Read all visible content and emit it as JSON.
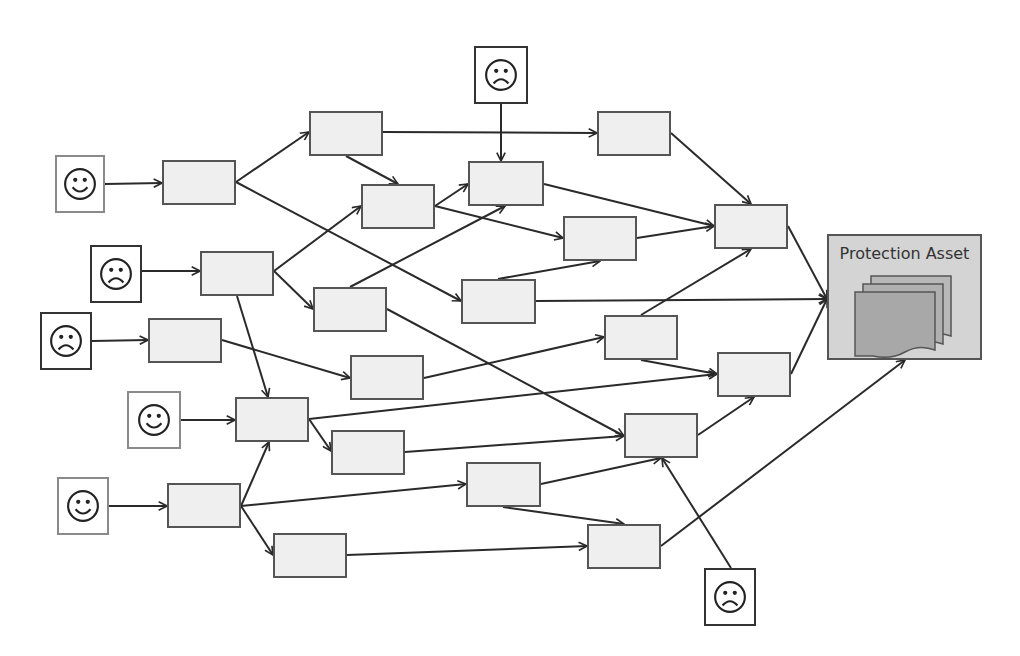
{
  "diagram": {
    "type": "attack-graph",
    "colors": {
      "background": "#ffffff",
      "node_fill": "#efefef",
      "node_border": "#555555",
      "asset_fill": "#d4d4d4",
      "edge": "#2a2a2a",
      "doc_fill": "#a8a8a8"
    },
    "asset": {
      "id": "asset",
      "label": "Protection Asset",
      "icon": "stacked-documents-icon",
      "x": 827,
      "y": 234,
      "w": 155,
      "h": 126
    },
    "actors": [
      {
        "id": "A1",
        "kind": "happy",
        "icon": "smiley-face-icon",
        "x": 55,
        "y": 155,
        "w": 50,
        "h": 58
      },
      {
        "id": "A2",
        "kind": "sad",
        "icon": "frowning-face-icon",
        "x": 90,
        "y": 245,
        "w": 52,
        "h": 58
      },
      {
        "id": "A3",
        "kind": "sad",
        "icon": "frowning-face-icon",
        "x": 40,
        "y": 312,
        "w": 52,
        "h": 58
      },
      {
        "id": "A4",
        "kind": "happy",
        "icon": "smiley-face-icon",
        "x": 127,
        "y": 391,
        "w": 54,
        "h": 58
      },
      {
        "id": "A5",
        "kind": "happy",
        "icon": "smiley-face-icon",
        "x": 57,
        "y": 477,
        "w": 52,
        "h": 58
      },
      {
        "id": "A6",
        "kind": "sad",
        "icon": "frowning-face-icon",
        "x": 474,
        "y": 46,
        "w": 54,
        "h": 58
      },
      {
        "id": "A7",
        "kind": "sad",
        "icon": "frowning-face-icon",
        "x": 704,
        "y": 568,
        "w": 52,
        "h": 58
      }
    ],
    "nodes": [
      {
        "id": "N1",
        "x": 162,
        "y": 160,
        "w": 74,
        "h": 45
      },
      {
        "id": "N2",
        "x": 200,
        "y": 251,
        "w": 74,
        "h": 45
      },
      {
        "id": "N3",
        "x": 148,
        "y": 318,
        "w": 74,
        "h": 45
      },
      {
        "id": "N4",
        "x": 235,
        "y": 397,
        "w": 74,
        "h": 45
      },
      {
        "id": "N5",
        "x": 167,
        "y": 483,
        "w": 74,
        "h": 45
      },
      {
        "id": "N6",
        "x": 309,
        "y": 111,
        "w": 74,
        "h": 45
      },
      {
        "id": "N7",
        "x": 361,
        "y": 184,
        "w": 74,
        "h": 45
      },
      {
        "id": "N8",
        "x": 313,
        "y": 287,
        "w": 74,
        "h": 45
      },
      {
        "id": "N9",
        "x": 350,
        "y": 355,
        "w": 74,
        "h": 45
      },
      {
        "id": "N10",
        "x": 331,
        "y": 430,
        "w": 74,
        "h": 45
      },
      {
        "id": "N11",
        "x": 273,
        "y": 533,
        "w": 74,
        "h": 45
      },
      {
        "id": "N12",
        "x": 468,
        "y": 161,
        "w": 76,
        "h": 45
      },
      {
        "id": "N13",
        "x": 461,
        "y": 279,
        "w": 75,
        "h": 45
      },
      {
        "id": "N14",
        "x": 466,
        "y": 462,
        "w": 75,
        "h": 45
      },
      {
        "id": "N15",
        "x": 597,
        "y": 111,
        "w": 74,
        "h": 45
      },
      {
        "id": "N16",
        "x": 563,
        "y": 216,
        "w": 74,
        "h": 45
      },
      {
        "id": "N17",
        "x": 604,
        "y": 315,
        "w": 74,
        "h": 45
      },
      {
        "id": "N18",
        "x": 624,
        "y": 413,
        "w": 74,
        "h": 45
      },
      {
        "id": "N19",
        "x": 587,
        "y": 524,
        "w": 74,
        "h": 45
      },
      {
        "id": "N20",
        "x": 714,
        "y": 204,
        "w": 74,
        "h": 45
      },
      {
        "id": "N21",
        "x": 717,
        "y": 352,
        "w": 74,
        "h": 45
      }
    ],
    "edges": [
      {
        "from": [
          105,
          184
        ],
        "to": [
          162,
          183
        ]
      },
      {
        "from": [
          142,
          271
        ],
        "to": [
          200,
          271
        ]
      },
      {
        "from": [
          92,
          341
        ],
        "to": [
          148,
          340
        ]
      },
      {
        "from": [
          181,
          420
        ],
        "to": [
          235,
          420
        ]
      },
      {
        "from": [
          109,
          506
        ],
        "to": [
          167,
          506
        ]
      },
      {
        "from": [
          501,
          104
        ],
        "to": [
          501,
          161
        ]
      },
      {
        "from": [
          731,
          568
        ],
        "to": [
          662,
          458
        ]
      },
      {
        "from": [
          236,
          182
        ],
        "to": [
          309,
          132
        ]
      },
      {
        "from": [
          236,
          182
        ],
        "to": [
          461,
          301
        ]
      },
      {
        "from": [
          383,
          132
        ],
        "to": [
          597,
          133
        ]
      },
      {
        "from": [
          346,
          156
        ],
        "to": [
          398,
          184
        ]
      },
      {
        "from": [
          274,
          271
        ],
        "to": [
          361,
          206
        ]
      },
      {
        "from": [
          274,
          271
        ],
        "to": [
          313,
          309
        ]
      },
      {
        "from": [
          237,
          296
        ],
        "to": [
          268,
          397
        ]
      },
      {
        "from": [
          222,
          340
        ],
        "to": [
          350,
          378
        ]
      },
      {
        "from": [
          309,
          419
        ],
        "to": [
          331,
          451
        ]
      },
      {
        "from": [
          241,
          506
        ],
        "to": [
          269,
          442
        ]
      },
      {
        "from": [
          241,
          506
        ],
        "to": [
          466,
          484
        ]
      },
      {
        "from": [
          241,
          506
        ],
        "to": [
          273,
          555
        ]
      },
      {
        "from": [
          435,
          206
        ],
        "to": [
          468,
          184
        ]
      },
      {
        "from": [
          435,
          206
        ],
        "to": [
          563,
          238
        ]
      },
      {
        "from": [
          350,
          287
        ],
        "to": [
          505,
          206
        ]
      },
      {
        "from": [
          387,
          309
        ],
        "to": [
          624,
          436
        ]
      },
      {
        "from": [
          424,
          378
        ],
        "to": [
          604,
          337
        ]
      },
      {
        "from": [
          309,
          419
        ],
        "to": [
          717,
          374
        ]
      },
      {
        "from": [
          405,
          452
        ],
        "to": [
          624,
          436
        ]
      },
      {
        "from": [
          347,
          555
        ],
        "to": [
          587,
          546
        ]
      },
      {
        "from": [
          544,
          184
        ],
        "to": [
          714,
          226
        ]
      },
      {
        "from": [
          498,
          279
        ],
        "to": [
          600,
          261
        ]
      },
      {
        "from": [
          536,
          301
        ],
        "to": [
          827,
          299
        ]
      },
      {
        "from": [
          541,
          484
        ],
        "to": [
          661,
          458
        ]
      },
      {
        "from": [
          503,
          507
        ],
        "to": [
          624,
          524
        ]
      },
      {
        "from": [
          671,
          133
        ],
        "to": [
          751,
          204
        ]
      },
      {
        "from": [
          637,
          238
        ],
        "to": [
          714,
          226
        ]
      },
      {
        "from": [
          641,
          315
        ],
        "to": [
          751,
          249
        ]
      },
      {
        "from": [
          641,
          360
        ],
        "to": [
          717,
          374
        ]
      },
      {
        "from": [
          698,
          435
        ],
        "to": [
          754,
          397
        ]
      },
      {
        "from": [
          661,
          546
        ],
        "to": [
          905,
          360
        ]
      },
      {
        "from": [
          788,
          226
        ],
        "to": [
          827,
          299
        ]
      },
      {
        "from": [
          791,
          374
        ],
        "to": [
          827,
          299
        ]
      }
    ]
  }
}
